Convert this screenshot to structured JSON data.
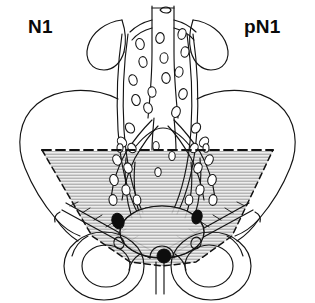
{
  "figure": {
    "left_label": "N1",
    "right_label": "pN1",
    "background_color": "#ffffff",
    "ink_color": "#111111",
    "shade_fill": "#e6e6e6",
    "hatch_color": "#9a9a9a",
    "metastatic_node_color": "#0d0d0d",
    "node_outline_color": "#1a1a1a",
    "node_fill_color": "#ffffff",
    "boundary_style": "dashed",
    "boundary_label": "pelvic brim",
    "anatomy": {
      "kidney_left": "left kidney",
      "kidney_right": "right kidney",
      "ureter_left": "left ureter",
      "ureter_right": "right ureter",
      "aorta": "abdominal aorta",
      "vena_cava": "inferior vena cava",
      "common_iliac_left": "left common iliac vessel",
      "common_iliac_right": "right common iliac vessel",
      "iliac_wing_left": "left iliac wing",
      "iliac_wing_right": "right iliac wing",
      "bladder": "urinary bladder",
      "obturator_foramen_left": "left obturator foramen",
      "obturator_foramen_right": "right obturator foramen",
      "pubic_symphysis": "pubic symphysis",
      "inguinal_band_left": "left inguinal/external iliac band",
      "inguinal_band_right": "right inguinal/external iliac band"
    },
    "node_counts": {
      "paraaortic_nodes": 14,
      "iliac_nodes": 18,
      "metastatic_nodes": 3
    },
    "metastatic_nodes": [
      {
        "name": "left-metastatic-node",
        "x": 118,
        "y": 221,
        "rx": 6,
        "ry": 8,
        "rotate": -18
      },
      {
        "name": "right-metastatic-node",
        "x": 197,
        "y": 217,
        "rx": 5,
        "ry": 7,
        "rotate": 16
      },
      {
        "name": "midline-metastatic-node",
        "x": 164,
        "y": 256,
        "rx": 7,
        "ry": 7,
        "rotate": 0
      }
    ]
  }
}
